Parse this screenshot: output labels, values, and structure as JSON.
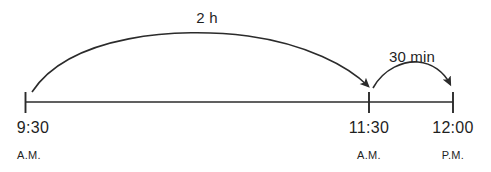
{
  "diagram": {
    "type": "number-line-elapsed-time",
    "line_color": "#2b2b2b",
    "text_color": "#1f1f1f",
    "ticks": [
      {
        "id": "start",
        "time": "9:30",
        "period": "A.M.",
        "x": 25
      },
      {
        "id": "middle",
        "time": "11:30",
        "period": "A.M.",
        "x": 369
      },
      {
        "id": "end",
        "time": "12:00",
        "period": "P.M.",
        "x": 453
      }
    ],
    "jumps": [
      {
        "id": "first-jump",
        "label": "2 h",
        "from": "9:30",
        "to": "11:30"
      },
      {
        "id": "second-jump",
        "label": "30 min",
        "from": "11:30",
        "to": "12:00"
      }
    ]
  }
}
